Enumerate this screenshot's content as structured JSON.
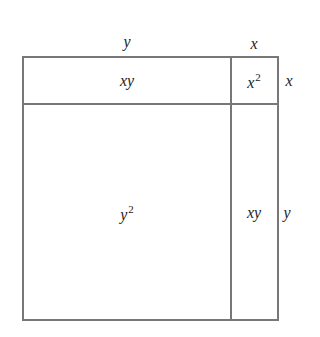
{
  "diagram": {
    "title": "",
    "line_color": "#777777",
    "text_color": "#222222",
    "outer_labels": {
      "top_left": "y",
      "top_right": "x",
      "right_top": "x",
      "right_bottom": "y"
    },
    "cells": {
      "top_left": {
        "base": "xy",
        "exp": ""
      },
      "top_right": {
        "base": "x",
        "exp": "2"
      },
      "bottom_left": {
        "base": "y",
        "exp": "2"
      },
      "bottom_right": {
        "base": "xy",
        "exp": ""
      }
    }
  }
}
